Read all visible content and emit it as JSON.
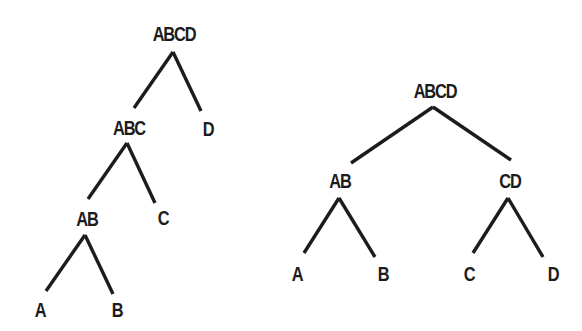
{
  "colors": {
    "background": "#ffffff",
    "ink": "#1c1c1c"
  },
  "trees": [
    {
      "name": "left-skewed-tree",
      "nodes": [
        {
          "id": "ABCD",
          "label": "ABCD",
          "x": 174,
          "y": 34
        },
        {
          "id": "ABC",
          "label": "ABC",
          "x": 129,
          "y": 128
        },
        {
          "id": "D",
          "label": "D",
          "x": 208,
          "y": 129
        },
        {
          "id": "AB",
          "label": "AB",
          "x": 87,
          "y": 219
        },
        {
          "id": "C",
          "label": "C",
          "x": 163,
          "y": 218
        },
        {
          "id": "A",
          "label": "A",
          "x": 40,
          "y": 310
        },
        {
          "id": "B",
          "label": "B",
          "x": 117,
          "y": 310
        }
      ],
      "edges": [
        {
          "from": "ABCD",
          "to": "ABC",
          "x1": 173,
          "y1": 52,
          "x2": 134,
          "y2": 108
        },
        {
          "from": "ABCD",
          "to": "D",
          "x1": 173,
          "y1": 52,
          "x2": 201,
          "y2": 111
        },
        {
          "from": "ABC",
          "to": "AB",
          "x1": 127,
          "y1": 143,
          "x2": 88,
          "y2": 199
        },
        {
          "from": "ABC",
          "to": "C",
          "x1": 127,
          "y1": 143,
          "x2": 155,
          "y2": 203
        },
        {
          "from": "AB",
          "to": "A",
          "x1": 85,
          "y1": 235,
          "x2": 46,
          "y2": 291
        },
        {
          "from": "AB",
          "to": "B",
          "x1": 85,
          "y1": 235,
          "x2": 113,
          "y2": 294
        }
      ]
    },
    {
      "name": "balanced-tree",
      "nodes": [
        {
          "id": "ABCD",
          "label": "ABCD",
          "x": 435,
          "y": 91
        },
        {
          "id": "AB",
          "label": "AB",
          "x": 340,
          "y": 181
        },
        {
          "id": "CD",
          "label": "CD",
          "x": 510,
          "y": 181
        },
        {
          "id": "A",
          "label": "A",
          "x": 297,
          "y": 274
        },
        {
          "id": "B",
          "label": "B",
          "x": 383,
          "y": 274
        },
        {
          "id": "C",
          "label": "C",
          "x": 469,
          "y": 274
        },
        {
          "id": "D",
          "label": "D",
          "x": 553,
          "y": 274
        }
      ],
      "edges": [
        {
          "from": "ABCD",
          "to": "AB",
          "x1": 433,
          "y1": 107,
          "x2": 351,
          "y2": 163
        },
        {
          "from": "ABCD",
          "to": "CD",
          "x1": 433,
          "y1": 107,
          "x2": 511,
          "y2": 160
        },
        {
          "from": "AB",
          "to": "A",
          "x1": 339,
          "y1": 198,
          "x2": 304,
          "y2": 253
        },
        {
          "from": "AB",
          "to": "B",
          "x1": 339,
          "y1": 198,
          "x2": 375,
          "y2": 257
        },
        {
          "from": "CD",
          "to": "C",
          "x1": 508,
          "y1": 198,
          "x2": 473,
          "y2": 253
        },
        {
          "from": "CD",
          "to": "D",
          "x1": 508,
          "y1": 198,
          "x2": 543,
          "y2": 257
        }
      ]
    }
  ]
}
